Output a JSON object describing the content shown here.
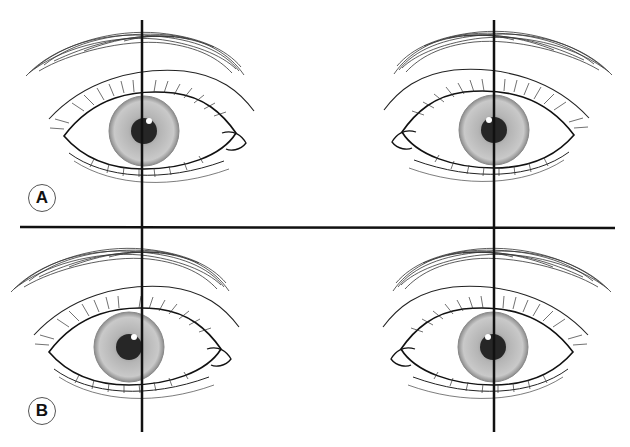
{
  "figure": {
    "panels": [
      {
        "label": "A",
        "label_pos": [
          41,
          197
        ],
        "eyes": [
          {
            "side": "left",
            "cx": 144,
            "cy": 131,
            "iris_r": 35,
            "pupil_r": 13,
            "caruncle": "right"
          },
          {
            "side": "right",
            "cx": 494,
            "cy": 130,
            "iris_r": 35,
            "pupil_r": 13,
            "caruncle": "left"
          }
        ]
      },
      {
        "label": "B",
        "label_pos": [
          41,
          410
        ],
        "eyes": [
          {
            "side": "left",
            "cx": 129,
            "cy": 347,
            "iris_r": 35,
            "pupil_r": 13,
            "caruncle": "right"
          },
          {
            "side": "right",
            "cx": 493,
            "cy": 347,
            "iris_r": 35,
            "pupil_r": 13,
            "caruncle": "left"
          }
        ]
      }
    ],
    "reference_lines": {
      "vertical_x": [
        142,
        494
      ],
      "vertical_y": [
        20,
        432
      ],
      "horizontal_y": 227,
      "horizontal_x": [
        20,
        615
      ]
    },
    "colors": {
      "line": "#111111",
      "iris_outer": "#9a9a9a",
      "iris_inner": "#c8c8c8",
      "pupil": "#2a2a2a",
      "sclera": "#ffffff"
    }
  }
}
